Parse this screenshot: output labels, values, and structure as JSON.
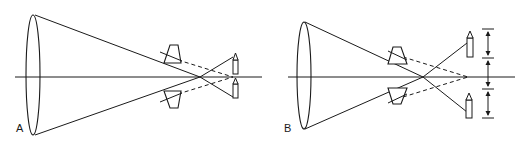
{
  "figure": {
    "panels": [
      {
        "id": "A",
        "label": "A",
        "description": "Convex lens with two prisms; rays cross and form two separate candle images close to the axis (doubled image)."
      },
      {
        "id": "B",
        "label": "B",
        "description": "Convex lens with two prisms; rays cross and form two candle images displaced farther apart, with measurement arrows indicating separation."
      }
    ],
    "colors": {
      "stroke": "#1a1a1a",
      "background": "#ffffff"
    }
  }
}
